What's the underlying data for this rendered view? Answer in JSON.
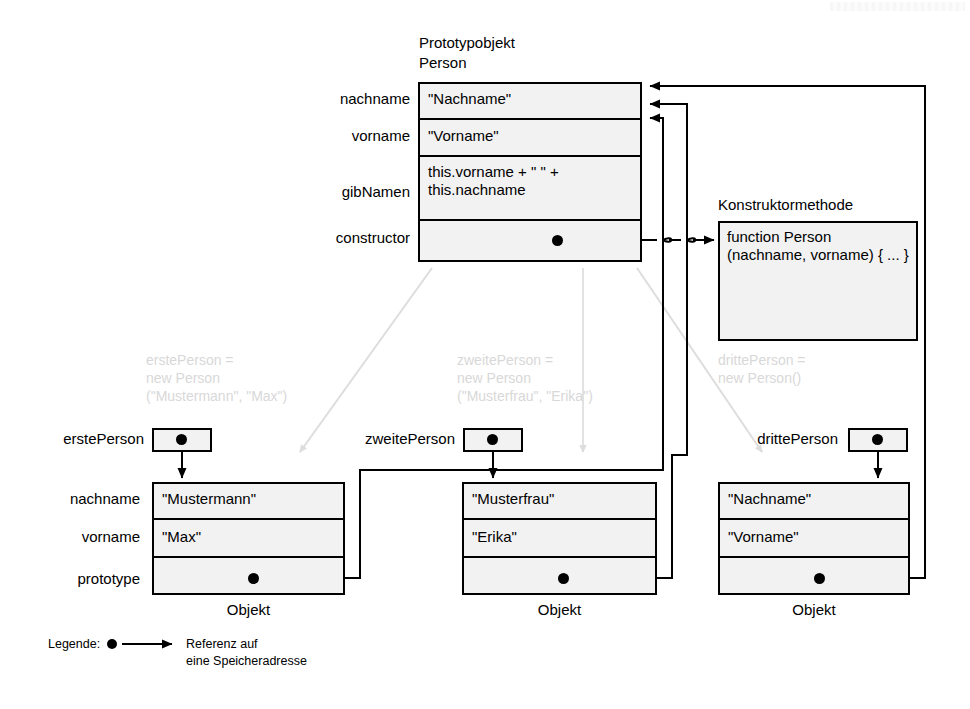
{
  "diagram": {
    "title_note": "JavaScript Prototypobjekt / Objekt Referenzdiagramm",
    "prototype": {
      "caption_line1": "Prototypobjekt",
      "caption_line2": "Person",
      "fields": [
        {
          "name": "nachname",
          "value": "\"Nachname\""
        },
        {
          "name": "vorname",
          "value": "\"Vorname\""
        },
        {
          "name": "gibNamen",
          "value": "this.vorname + \" \" +\nthis.nachname"
        },
        {
          "name": "constructor",
          "value": ""
        }
      ]
    },
    "constructor_method": {
      "caption": "Konstruktormethode",
      "code": "function Person\n(nachname, vorname)\n{\n...\n}"
    },
    "row_labels": [
      "nachname",
      "vorname",
      "prototype"
    ],
    "objects": [
      {
        "variable": "erstePerson",
        "caption": "Objekt",
        "ghost": "erstePerson =\nnew Person\n(\"Mustermann\", \"Max\")",
        "values": [
          "\"Mustermann\"",
          "\"Max\"",
          ""
        ]
      },
      {
        "variable": "zweitePerson",
        "caption": "Objekt",
        "ghost": "zweitePerson =\nnew Person\n(\"Musterfrau\", \"Erika\")",
        "values": [
          "\"Musterfrau\"",
          "\"Erika\"",
          ""
        ]
      },
      {
        "variable": "drittePerson",
        "caption": "Objekt",
        "ghost": "drittePerson =\nnew Person()",
        "values": [
          "\"Nachname\"",
          "\"Vorname\"",
          ""
        ]
      }
    ],
    "legend": {
      "label": "Legende:",
      "description_line1": "Referenz auf",
      "description_line2": "eine Speicheradresse"
    },
    "colors": {
      "stroke": "#000000",
      "cell_fill": "#f2f2f2",
      "ghost": "#d8d8d8",
      "background": "#ffffff"
    }
  }
}
